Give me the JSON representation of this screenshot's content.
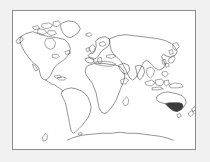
{
  "page": {
    "background_color": "#f1f1f1"
  },
  "map": {
    "title": "World Map",
    "frame": {
      "border_color": "#8a8a8a",
      "background_color": "#ffffff",
      "x": 12,
      "y": 10,
      "width": 184,
      "height": 140
    },
    "projection": "equirectangular",
    "coastline_color": "#3a3a3a",
    "highlight_color": "#3c3c3c",
    "highlighted_regions": [
      "Australia"
    ],
    "regions": [
      {
        "name": "North America",
        "label": "North America",
        "highlighted": false
      },
      {
        "name": "Greenland",
        "label": "Greenland",
        "highlighted": false
      },
      {
        "name": "South America",
        "label": "South America",
        "highlighted": false
      },
      {
        "name": "Europe",
        "label": "Europe",
        "highlighted": false
      },
      {
        "name": "Africa",
        "label": "Africa",
        "highlighted": false
      },
      {
        "name": "Asia",
        "label": "Asia",
        "highlighted": false
      },
      {
        "name": "Australia",
        "label": "Australia",
        "highlighted": true
      },
      {
        "name": "New Zealand",
        "label": "New Zealand",
        "highlighted": false
      },
      {
        "name": "Antarctica",
        "label": "Antarctica",
        "highlighted": false
      },
      {
        "name": "Madagascar",
        "label": "Madagascar",
        "highlighted": false
      },
      {
        "name": "Japan",
        "label": "Japan",
        "highlighted": false
      },
      {
        "name": "British Isles",
        "label": "British Isles",
        "highlighted": false
      },
      {
        "name": "Indonesia",
        "label": "Indonesia",
        "highlighted": false
      },
      {
        "name": "Philippines",
        "label": "Philippines",
        "highlighted": false
      },
      {
        "name": "Iceland",
        "label": "Iceland",
        "highlighted": false
      },
      {
        "name": "Falkland Islands",
        "label": "Falkland Islands",
        "highlighted": false
      }
    ]
  }
}
